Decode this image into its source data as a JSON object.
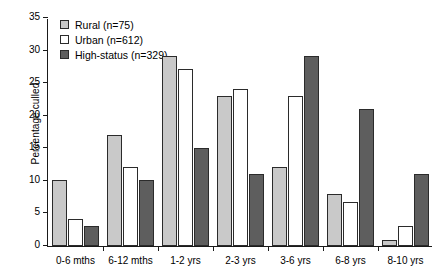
{
  "chart_data": {
    "type": "bar",
    "title": "",
    "xlabel": "",
    "ylabel": "Percentage culled",
    "ylim": [
      0,
      35
    ],
    "yticks": [
      0,
      5,
      10,
      15,
      20,
      25,
      30,
      35
    ],
    "grid": false,
    "legend_position": "top-left",
    "categories": [
      "0-6 mths",
      "6-12 mths",
      "1-2 yrs",
      "2-3 yrs",
      "3-6 yrs",
      "6-8 yrs",
      "8-10 yrs"
    ],
    "series": [
      {
        "name": "Rural (n=75)",
        "key": "rural",
        "color": "#c9c9c9",
        "values": [
          10.2,
          17.1,
          29.1,
          23.1,
          12.1,
          8.0,
          0.9
        ]
      },
      {
        "name": "Urban (n=612)",
        "key": "urban",
        "color": "#ffffff",
        "values": [
          4.2,
          12.2,
          27.1,
          24.1,
          23.0,
          6.8,
          3.0
        ]
      },
      {
        "name": "High-status (n=329)",
        "key": "high",
        "color": "#5e5e5e",
        "values": [
          3.0,
          10.1,
          15.0,
          11.1,
          29.2,
          21.0,
          11.0
        ]
      }
    ]
  },
  "legend": {
    "items": [
      {
        "label": "Rural (n=75)",
        "swatch": "rural"
      },
      {
        "label": "Urban (n=612)",
        "swatch": "urban"
      },
      {
        "label": "High-status (n=329)",
        "swatch": "high"
      }
    ]
  },
  "axis": {
    "y_label": "Percentage culled"
  }
}
